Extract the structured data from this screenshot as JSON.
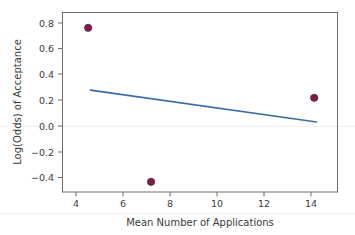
{
  "chart_data": {
    "type": "scatter",
    "title": "",
    "subtitle": "",
    "xlabel": "Mean Number of Applications",
    "ylabel": "Log(Odds) of Acceptance",
    "xlim": [
      3.2,
      15.0
    ],
    "ylim": [
      -0.52,
      0.89
    ],
    "xticks": [
      4,
      6,
      8,
      10,
      12,
      14
    ],
    "xtick_labels": [
      "4",
      "6",
      "8",
      "10",
      "12",
      "14"
    ],
    "yticks": [
      0.8,
      0.6,
      0.4,
      0.2,
      0.0,
      -0.2,
      -0.4
    ],
    "ytick_labels": [
      "0.8",
      "0.6",
      "0.4",
      "0.2",
      "0.0",
      "−0.2",
      "−0.4"
    ],
    "grid": false,
    "legend": null,
    "legend_position": "none",
    "points": [
      {
        "x": 4.3,
        "y": 0.77
      },
      {
        "x": 7.0,
        "y": -0.44
      },
      {
        "x": 14.0,
        "y": 0.22
      }
    ],
    "series": [
      {
        "name": "Observations",
        "type": "scatter",
        "marker": "filled-circle",
        "color": "#7B1F47",
        "x": [
          4.3,
          7.0,
          14.0
        ],
        "values": [
          0.77,
          -0.44,
          0.22
        ]
      },
      {
        "name": "Fitted regression line",
        "type": "line",
        "color": "#3A6BA5",
        "x": [
          4.4,
          14.1
        ],
        "values": [
          0.28,
          0.03
        ]
      }
    ],
    "annotations": []
  },
  "colors": {
    "point_fill": "#7B1F47",
    "point_stroke": "#5D1536",
    "line": "#3A6BA5",
    "axis": "#6E6E6E",
    "text": "#3B3B3B",
    "background": "#FFFFFF"
  },
  "axis": {
    "x_title": "Mean Number of Applications",
    "y_title": "Log(Odds) of Acceptance"
  },
  "tick_text": {
    "x": [
      "4",
      "6",
      "8",
      "10",
      "12",
      "14"
    ],
    "y": [
      "0.8",
      "0.6",
      "0.4",
      "0.2",
      "0.0",
      "−0.2",
      "−0.4"
    ]
  }
}
